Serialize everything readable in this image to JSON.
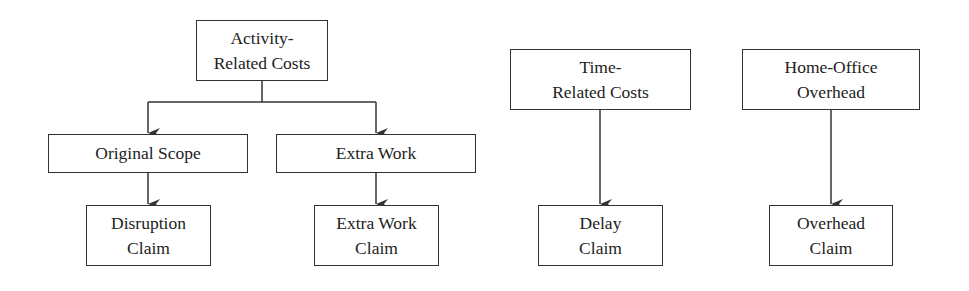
{
  "diagram": {
    "type": "flow-hierarchy",
    "nodes": {
      "activity_costs": {
        "line1": "Activity-",
        "line2": "Related Costs"
      },
      "original_scope": {
        "line1": "Original Scope"
      },
      "extra_work": {
        "line1": "Extra Work"
      },
      "disruption_claim": {
        "line1": "Disruption",
        "line2": "Claim"
      },
      "extra_work_claim": {
        "line1": "Extra Work",
        "line2": "Claim"
      },
      "time_costs": {
        "line1": "Time-",
        "line2": "Related Costs"
      },
      "delay_claim": {
        "line1": "Delay",
        "line2": "Claim"
      },
      "home_office": {
        "line1": "Home-Office",
        "line2": "Overhead"
      },
      "overhead_claim": {
        "line1": "Overhead",
        "line2": "Claim"
      }
    },
    "edges": [
      {
        "from": "Activity-Related Costs",
        "to": "Original Scope"
      },
      {
        "from": "Activity-Related Costs",
        "to": "Extra Work"
      },
      {
        "from": "Original Scope",
        "to": "Disruption Claim"
      },
      {
        "from": "Extra Work",
        "to": "Extra Work Claim"
      },
      {
        "from": "Time-Related Costs",
        "to": "Delay Claim"
      },
      {
        "from": "Home-Office Overhead",
        "to": "Overhead Claim"
      }
    ],
    "colors": {
      "line": "#333333",
      "background": "#ffffff",
      "text": "#222222"
    }
  }
}
